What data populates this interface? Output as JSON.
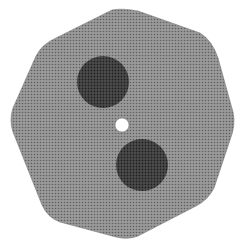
{
  "figure": {
    "shape": "rounded-heptagon-disc",
    "colors": {
      "background": "#ffffff",
      "disc_fill": "#8c8c8c",
      "disc_dot": "#5a5a5a",
      "hole_fill": "#4a4a4a",
      "hole_dot": "#1e1e1e",
      "center_hole": "#ffffff"
    },
    "holes": [
      {
        "name": "upper-dark-circle",
        "cx": 103,
        "cy": 82,
        "r": 26
      },
      {
        "name": "lower-dark-circle",
        "cx": 142,
        "cy": 165,
        "r": 26
      }
    ],
    "center": {
      "cx": 122,
      "cy": 125,
      "r": 7
    }
  }
}
